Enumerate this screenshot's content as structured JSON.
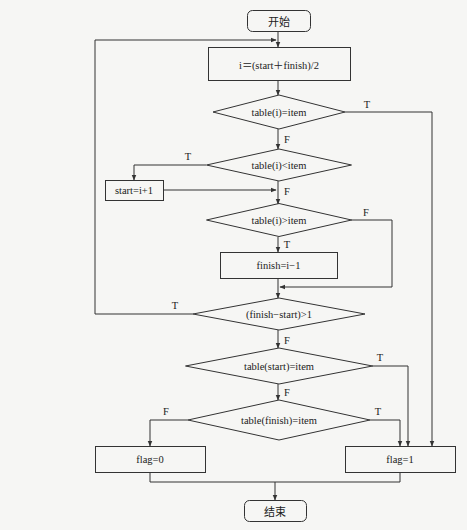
{
  "diagram": {
    "type": "flowchart",
    "title": "",
    "background_color": "#f6f6f4",
    "line_color": "#333333",
    "nodes": [
      {
        "id": "start",
        "shape": "terminal",
        "label": "开始",
        "x": 247,
        "y": 10,
        "w": 63,
        "h": 21
      },
      {
        "id": "calc_mid",
        "shape": "process",
        "label": "i＝(start＋finish)/2",
        "x": 208,
        "y": 47,
        "w": 142,
        "h": 33
      },
      {
        "id": "eq_check",
        "shape": "decision",
        "label": "table(i)=item",
        "cx": 279,
        "cy": 112,
        "w": 132,
        "h": 34
      },
      {
        "id": "lt_check",
        "shape": "decision",
        "label": "table(i)<item",
        "cx": 279,
        "cy": 165,
        "w": 145,
        "h": 32
      },
      {
        "id": "set_start",
        "shape": "process",
        "label": "start=i+1",
        "x": 105,
        "y": 180,
        "w": 58,
        "h": 20
      },
      {
        "id": "gt_check",
        "shape": "decision",
        "label": "table(i)>item",
        "cx": 279,
        "cy": 220,
        "w": 145,
        "h": 33
      },
      {
        "id": "set_finish",
        "shape": "process",
        "label": "finish=i−1",
        "x": 220,
        "y": 252,
        "w": 117,
        "h": 26
      },
      {
        "id": "range_check",
        "shape": "decision",
        "label": "(finish−start)>1",
        "cx": 279,
        "cy": 314,
        "w": 172,
        "h": 32
      },
      {
        "id": "start_eq_check",
        "shape": "decision",
        "label": "table(start)=item",
        "cx": 279,
        "cy": 366,
        "w": 187,
        "h": 36
      },
      {
        "id": "finish_eq_check",
        "shape": "decision",
        "label": "table(finish)=item",
        "cx": 279,
        "cy": 420,
        "w": 182,
        "h": 40
      },
      {
        "id": "flag_zero",
        "shape": "process",
        "label": "flag=0",
        "x": 95,
        "y": 446,
        "w": 110,
        "h": 26
      },
      {
        "id": "flag_one",
        "shape": "process",
        "label": "flag=1",
        "x": 345,
        "y": 446,
        "w": 110,
        "h": 26
      },
      {
        "id": "end",
        "shape": "terminal",
        "label": "结束",
        "x": 244,
        "y": 500,
        "w": 62,
        "h": 21
      }
    ],
    "edges": [
      {
        "from": "start",
        "to": "calc_mid",
        "label": "",
        "points": [
          [
            278,
            31
          ],
          [
            278,
            47
          ]
        ]
      },
      {
        "from": "calc_mid",
        "to": "eq_check",
        "label": "",
        "points": [
          [
            278,
            80
          ],
          [
            278,
            95
          ]
        ]
      },
      {
        "from": "eq_check",
        "to": "flag_one",
        "label": "T",
        "points": [
          [
            345,
            112
          ],
          [
            432,
            112
          ],
          [
            432,
            446
          ]
        ],
        "label_pos": [
          367,
          104
        ]
      },
      {
        "from": "eq_check",
        "to": "lt_check",
        "label": "F",
        "points": [
          [
            278,
            129
          ],
          [
            278,
            149
          ]
        ],
        "label_pos": [
          287,
          139
        ]
      },
      {
        "from": "lt_check",
        "to": "set_start",
        "label": "T",
        "points": [
          [
            206,
            165
          ],
          [
            134,
            165
          ],
          [
            134,
            180
          ]
        ],
        "label_pos": [
          188,
          156
        ]
      },
      {
        "from": "lt_check",
        "to": "gt_check",
        "label": "F",
        "points": [
          [
            278,
            181
          ],
          [
            278,
            204
          ]
        ],
        "label_pos": [
          287,
          191
        ]
      },
      {
        "from": "set_start",
        "to": "gt_check",
        "label": "",
        "points": [
          [
            163,
            190
          ],
          [
            276,
            190
          ]
        ]
      },
      {
        "from": "gt_check",
        "to": "set_finish",
        "label": "T",
        "points": [
          [
            278,
            237
          ],
          [
            278,
            252
          ]
        ],
        "label_pos": [
          287,
          244
        ]
      },
      {
        "from": "gt_check",
        "to": "range_check",
        "label": "F",
        "points": [
          [
            351,
            220
          ],
          [
            392,
            220
          ],
          [
            392,
            287
          ],
          [
            280,
            287
          ]
        ],
        "label_pos": [
          366,
          212
        ]
      },
      {
        "from": "set_finish",
        "to": "range_check",
        "label": "",
        "points": [
          [
            278,
            278
          ],
          [
            278,
            298
          ]
        ]
      },
      {
        "from": "range_check",
        "to": "calc_mid",
        "label": "T",
        "points": [
          [
            193,
            314
          ],
          [
            95,
            314
          ],
          [
            95,
            40
          ],
          [
            276,
            40
          ]
        ],
        "label_pos": [
          175,
          305
        ]
      },
      {
        "from": "range_check",
        "to": "start_eq_check",
        "label": "F",
        "points": [
          [
            278,
            330
          ],
          [
            278,
            348
          ]
        ],
        "label_pos": [
          287,
          340
        ]
      },
      {
        "from": "start_eq_check",
        "to": "flag_one",
        "label": "T",
        "points": [
          [
            372,
            366
          ],
          [
            408,
            366
          ],
          [
            408,
            446
          ]
        ],
        "label_pos": [
          380,
          357
        ]
      },
      {
        "from": "start_eq_check",
        "to": "finish_eq_check",
        "label": "F",
        "points": [
          [
            278,
            384
          ],
          [
            278,
            400
          ]
        ],
        "label_pos": [
          287,
          392
        ]
      },
      {
        "from": "finish_eq_check",
        "to": "flag_one",
        "label": "T",
        "points": [
          [
            370,
            420
          ],
          [
            400,
            420
          ],
          [
            400,
            446
          ]
        ],
        "label_pos": [
          378,
          411
        ]
      },
      {
        "from": "finish_eq_check",
        "to": "flag_zero",
        "label": "F",
        "points": [
          [
            188,
            420
          ],
          [
            150,
            420
          ],
          [
            150,
            446
          ]
        ],
        "label_pos": [
          166,
          411
        ]
      },
      {
        "from": "flag_zero",
        "to": "end",
        "label": "",
        "points": [
          [
            150,
            472
          ],
          [
            150,
            482
          ],
          [
            275,
            482
          ],
          [
            275,
            500
          ]
        ]
      },
      {
        "from": "flag_one",
        "to": "end",
        "label": "",
        "points": [
          [
            400,
            472
          ],
          [
            400,
            482
          ],
          [
            275,
            482
          ]
        ]
      }
    ]
  },
  "ghost_text_lines": [
    "⁠"
  ]
}
